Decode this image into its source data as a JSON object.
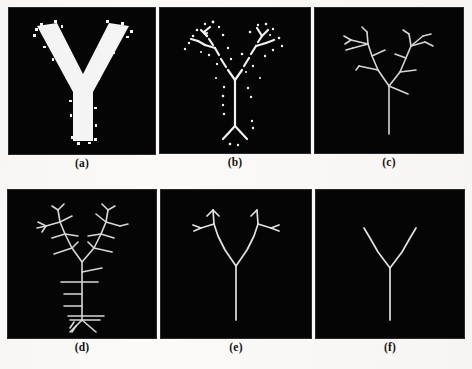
{
  "figure": {
    "kind": "image-grid",
    "rows": 2,
    "columns": 3,
    "page_background": "#fbfaf8",
    "panel_background": "#050505",
    "foreground": "#f2f2f2"
  },
  "panels": [
    {
      "id": "a",
      "caption": "(a)",
      "content_name": "binary-letter-y-original",
      "description": "Thick solid white letter Y on black background with ragged noisy boundary"
    },
    {
      "id": "b",
      "caption": "(b)",
      "content_name": "noisy-skeleton-with-speckles",
      "description": "Broken thinned skeleton of the Y with scattered isolated white speckle points"
    },
    {
      "id": "c",
      "caption": "(c)",
      "content_name": "skeleton-with-many-spurious-branches",
      "description": "Connected thin skeleton of the Y with numerous short spurious side branches on both arms"
    },
    {
      "id": "d",
      "caption": "(d)",
      "content_name": "skeleton-with-ladder-spurs",
      "description": "Thin skeleton with dense twig branches on the arms and horizontal ladder-like spurious rungs along the stem"
    },
    {
      "id": "e",
      "caption": "(e)",
      "content_name": "pruned-skeleton",
      "description": "Mostly pruned skeleton of the Y retaining a few small twigs at the arm tips"
    },
    {
      "id": "f",
      "caption": "(f)",
      "content_name": "clean-skeleton",
      "description": "Fully pruned clean medial axis skeleton of the Y with no spurious branches"
    }
  ]
}
